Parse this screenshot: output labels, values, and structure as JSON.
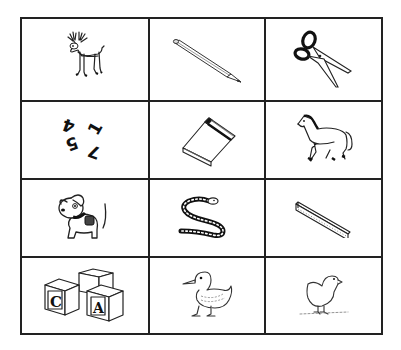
{
  "grid": {
    "rows": 4,
    "columns": 3,
    "cells": [
      {
        "label": "deer",
        "icon": "deer-icon"
      },
      {
        "label": "pencil",
        "icon": "pencil-icon"
      },
      {
        "label": "scissors",
        "icon": "scissors-icon"
      },
      {
        "label": "numbers",
        "icon": "numbers-icon",
        "digits": [
          "4",
          "5",
          "1",
          "7"
        ]
      },
      {
        "label": "book",
        "icon": "book-icon"
      },
      {
        "label": "horse",
        "icon": "horse-icon"
      },
      {
        "label": "dog",
        "icon": "dog-icon"
      },
      {
        "label": "snake",
        "icon": "snake-icon"
      },
      {
        "label": "ruler",
        "icon": "ruler-icon"
      },
      {
        "label": "blocks",
        "icon": "blocks-icon",
        "letters": [
          "C",
          "A"
        ]
      },
      {
        "label": "duck",
        "icon": "duck-icon"
      },
      {
        "label": "chick",
        "icon": "chick-icon"
      }
    ]
  },
  "colors": {
    "line": "#222222",
    "background": "#ffffff"
  }
}
